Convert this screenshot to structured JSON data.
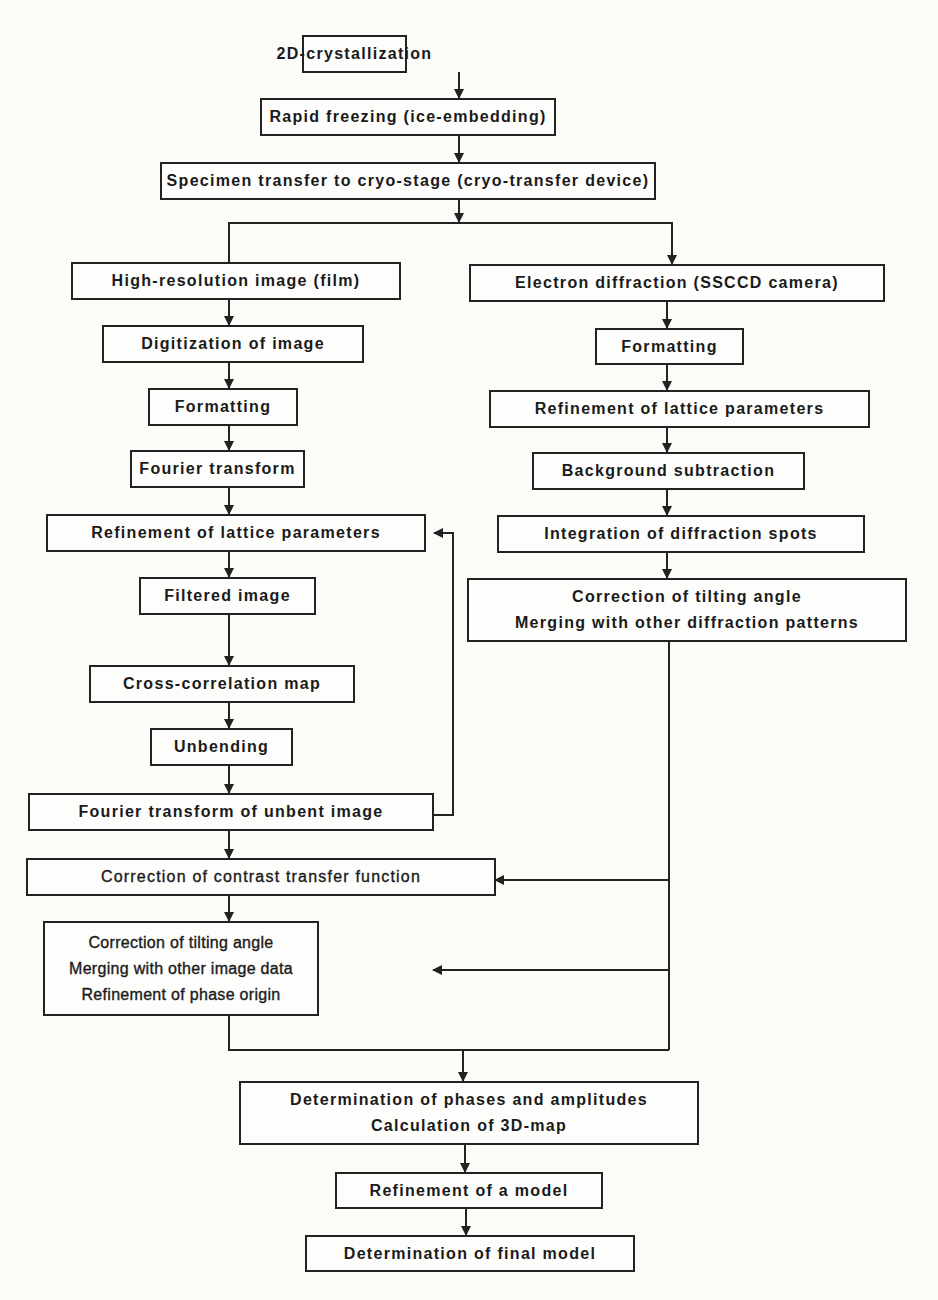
{
  "diagram": {
    "type": "flowchart",
    "nodes": {
      "crystallization": {
        "lines": [
          "2D-crystallization"
        ]
      },
      "freezing": {
        "lines": [
          "Rapid freezing (ice-embedding)"
        ]
      },
      "transfer": {
        "lines": [
          "Specimen transfer to cryo-stage (cryo-transfer device)"
        ]
      },
      "image_branch": {
        "high_res_image": {
          "lines": [
            "High-resolution image (film)"
          ]
        },
        "digitization": {
          "lines": [
            "Digitization of image"
          ]
        },
        "formatting": {
          "lines": [
            "Formatting"
          ]
        },
        "fourier": {
          "lines": [
            "Fourier transform"
          ]
        },
        "lattice": {
          "lines": [
            "Refinement of lattice parameters"
          ]
        },
        "filtered": {
          "lines": [
            "Filtered image"
          ]
        },
        "cross_corr": {
          "lines": [
            "Cross-correlation map"
          ]
        },
        "unbending": {
          "lines": [
            "Unbending"
          ]
        },
        "fourier_unbent": {
          "lines": [
            "Fourier transform of unbent image"
          ]
        },
        "ctf": {
          "lines": [
            "Correction of contrast transfer function"
          ]
        },
        "merge_image": {
          "lines": [
            "Correction of tilting angle",
            "Merging with other image data",
            "Refinement of phase origin"
          ]
        }
      },
      "diffraction_branch": {
        "electron_diff": {
          "lines": [
            "Electron diffraction (SSCCD camera)"
          ]
        },
        "formatting": {
          "lines": [
            "Formatting"
          ]
        },
        "lattice": {
          "lines": [
            "Refinement of lattice parameters"
          ]
        },
        "background": {
          "lines": [
            "Background subtraction"
          ]
        },
        "integration": {
          "lines": [
            "Integration of diffraction spots"
          ]
        },
        "merge_diff": {
          "lines": [
            "Correction of tilting angle",
            "Merging with other diffraction patterns"
          ]
        }
      },
      "phases": {
        "lines": [
          "Determination of phases and amplitudes",
          "Calculation of 3D-map"
        ]
      },
      "refine_model": {
        "lines": [
          "Refinement of a model"
        ]
      },
      "final_model": {
        "lines": [
          "Determination of final model"
        ]
      }
    },
    "edges": [
      [
        "crystallization",
        "freezing"
      ],
      [
        "freezing",
        "transfer"
      ],
      [
        "transfer",
        "image_branch.high_res_image"
      ],
      [
        "transfer",
        "diffraction_branch.electron_diff"
      ],
      [
        "image_branch.high_res_image",
        "image_branch.digitization"
      ],
      [
        "image_branch.digitization",
        "image_branch.formatting"
      ],
      [
        "image_branch.formatting",
        "image_branch.fourier"
      ],
      [
        "image_branch.fourier",
        "image_branch.lattice"
      ],
      [
        "image_branch.lattice",
        "image_branch.filtered"
      ],
      [
        "image_branch.filtered",
        "image_branch.cross_corr"
      ],
      [
        "image_branch.cross_corr",
        "image_branch.unbending"
      ],
      [
        "image_branch.unbending",
        "image_branch.fourier_unbent"
      ],
      [
        "image_branch.fourier_unbent",
        "image_branch.lattice"
      ],
      [
        "image_branch.fourier_unbent",
        "image_branch.ctf"
      ],
      [
        "image_branch.ctf",
        "image_branch.merge_image"
      ],
      [
        "diffraction_branch.electron_diff",
        "diffraction_branch.formatting"
      ],
      [
        "diffraction_branch.formatting",
        "diffraction_branch.lattice"
      ],
      [
        "diffraction_branch.lattice",
        "diffraction_branch.background"
      ],
      [
        "diffraction_branch.background",
        "diffraction_branch.integration"
      ],
      [
        "diffraction_branch.integration",
        "diffraction_branch.merge_diff"
      ],
      [
        "diffraction_branch.merge_diff",
        "image_branch.ctf"
      ],
      [
        "diffraction_branch.merge_diff",
        "image_branch.merge_image"
      ],
      [
        "diffraction_branch.merge_diff",
        "phases"
      ],
      [
        "image_branch.merge_image",
        "phases"
      ],
      [
        "phases",
        "refine_model"
      ],
      [
        "refine_model",
        "final_model"
      ]
    ]
  }
}
